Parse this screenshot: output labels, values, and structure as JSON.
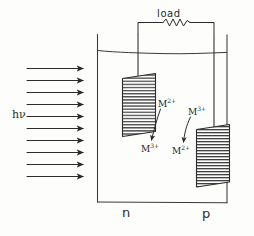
{
  "figure": {
    "kind": "hand-drawn line diagram",
    "ink_color": "#2b2b2b",
    "background_color": "#fdfdfc"
  },
  "circuit": {
    "load_label": "load",
    "resistor_name": "resistor-zigzag",
    "wire_name": "external-circuit-wire"
  },
  "illumination": {
    "photon_label": "hν",
    "arrow_count": 10,
    "direction": "left-to-right"
  },
  "cell": {
    "vessel_name": "electrolyte-tank",
    "electrolyte_surface_name": "liquid-level-line"
  },
  "electrodes": [
    {
      "id": "n",
      "label": "n",
      "type": "n-type semiconductor photoanode",
      "hatched": true
    },
    {
      "id": "p",
      "label": "p",
      "type": "p-type semiconductor photocathode",
      "hatched": true
    }
  ],
  "species": {
    "n_top": {
      "symbol": "M",
      "charge": "2+"
    },
    "n_bottom": {
      "symbol": "M",
      "charge": "3+"
    },
    "p_top": {
      "symbol": "M",
      "charge": "3+"
    },
    "p_bottom": {
      "symbol": "M",
      "charge": "2+"
    }
  },
  "redox_arrows": [
    {
      "name": "arrow-n-oxidation",
      "from": "n_top",
      "to": "n_bottom"
    },
    {
      "name": "arrow-p-reduction",
      "from": "p_top",
      "to": "p_bottom"
    }
  ]
}
